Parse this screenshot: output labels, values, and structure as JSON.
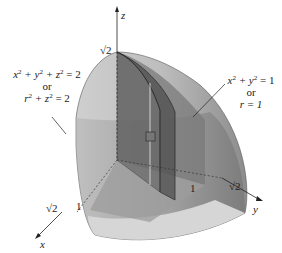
{
  "figure": {
    "axes": {
      "x": "x",
      "y": "y",
      "z": "z"
    },
    "ticks": {
      "z_top": "√2",
      "x_sqrt2": "√2",
      "x_one": "1",
      "y_sqrt2": "√2",
      "y_one": "1"
    },
    "labels": {
      "sphere": {
        "line1_a": "x",
        "line1_b": "2",
        "line1_c": " + y",
        "line1_d": "2",
        "line1_e": " + z",
        "line1_f": "2",
        "line1_g": " = 2",
        "or": "or",
        "line2_a": "r",
        "line2_b": "2",
        "line2_c": " + z",
        "line2_d": "2",
        "line2_e": " = 2"
      },
      "cylinder": {
        "line1_a": "x",
        "line1_b": "2",
        "line1_c": " + y",
        "line1_d": "2",
        "line1_e": " = 1",
        "or": "or",
        "line2": "r = 1"
      }
    },
    "colors": {
      "sphere_light": "#c9c9c9",
      "sphere_mid": "#a9a9a9",
      "sphere_dark": "#7d7d7d",
      "cylinder_band": "#8f8f8f",
      "wedge": "#6e6e6e",
      "base": "#d2d2d2"
    }
  }
}
